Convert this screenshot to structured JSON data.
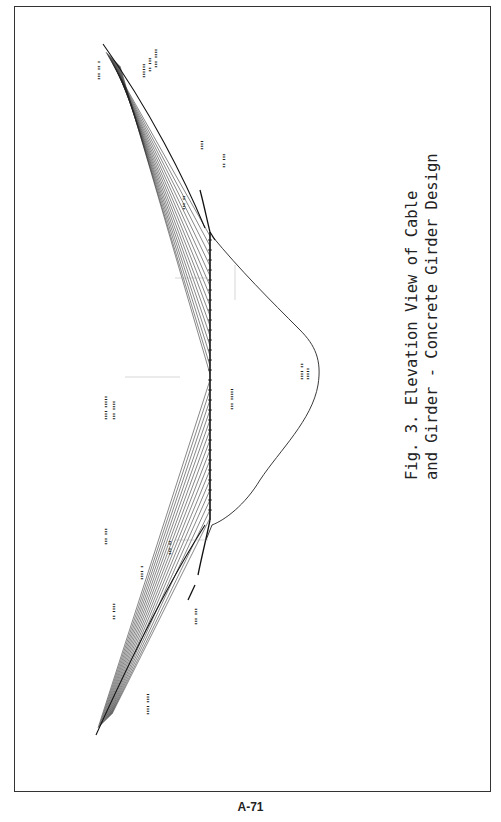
{
  "figure": {
    "number_label": "Fig. 3.",
    "caption_line1": "Fig. 3.  Elevation View of Cable",
    "caption_line2": "and Girder - Concrete Girder Design",
    "title": "Elevation View of Cable and Girder - Concrete Girder Design"
  },
  "page": {
    "number": "A-71"
  },
  "drawing": {
    "orientation": "rotated 90 degrees counter-clockwise",
    "elements": [
      {
        "name": "girder-deck",
        "description": "vertical deck line with tick marks"
      },
      {
        "name": "upper-cable-fan",
        "description": "stay cables fanning from upper anchorage to deck"
      },
      {
        "name": "lower-cable-fan",
        "description": "stay cables fanning from lower anchorage to deck"
      },
      {
        "name": "ground-profile",
        "description": "terrain / valley profile curve"
      },
      {
        "name": "annotation-labels",
        "description": "small rotated dimension and elevation notes (illegible at scan resolution)"
      }
    ]
  }
}
